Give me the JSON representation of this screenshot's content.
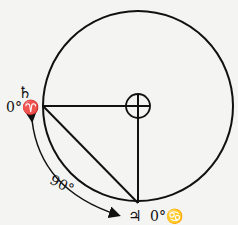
{
  "diagram": {
    "center_symbol": "earth",
    "labels": {
      "saturn_symbol": "♄",
      "aries_position": "0°♈",
      "jupiter_symbol": "♃",
      "cancer_position": "0°♋",
      "angle": "90°"
    },
    "colors": {
      "stroke": "#111111",
      "background": "#f4f4f2"
    }
  }
}
